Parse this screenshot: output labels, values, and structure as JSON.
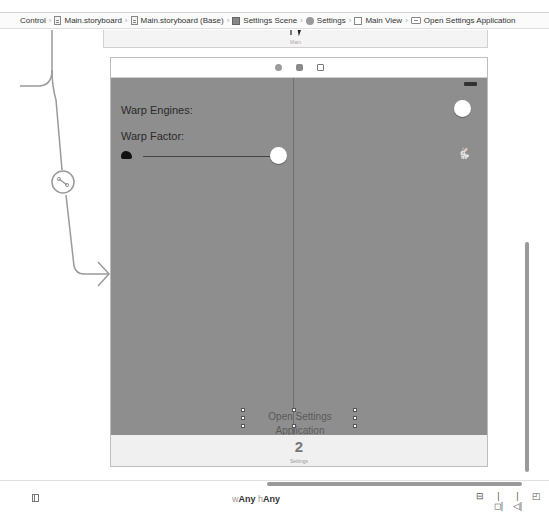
{
  "breadcrumb": {
    "items": [
      {
        "label": "Control",
        "icon": null
      },
      {
        "label": "Main.storyboard",
        "icon": "storyboard-icon"
      },
      {
        "label": "Main.storyboard (Base)",
        "icon": "storyboard-icon"
      },
      {
        "label": "Settings Scene",
        "icon": "scene-icon"
      },
      {
        "label": "Settings",
        "icon": "view-controller-icon"
      },
      {
        "label": "Main View",
        "icon": "view-icon"
      },
      {
        "label": "Open Settings Application",
        "icon": "button-icon"
      }
    ]
  },
  "canvas": {
    "top_scene_label": "Main",
    "scene": {
      "dock_icons": [
        "view-controller-icon",
        "first-responder-icon",
        "exit-icon"
      ],
      "labels": {
        "warp_engines": "Warp Engines:",
        "warp_factor": "Warp Factor:"
      },
      "slider": {
        "min_icon": "tortoise-icon",
        "max_icon": "hare-icon",
        "max_glyph": "🐇"
      },
      "open_settings_button": "Open Settings Application",
      "tab_bar": {
        "badge": "2",
        "label": "Settings"
      }
    }
  },
  "bottombar": {
    "size_class": {
      "w_prefix": "w",
      "w_value": "Any",
      "h_prefix": "h",
      "h_value": "Any"
    },
    "tools": [
      {
        "name": "align-tool",
        "glyph": "⊟"
      },
      {
        "name": "pin-tool",
        "glyph": "|◻|"
      },
      {
        "name": "resolve-issues-tool",
        "glyph": "|◁|"
      },
      {
        "name": "resizing-tool",
        "glyph": "◰"
      }
    ]
  },
  "colors": {
    "view_background": "#8e8e8e",
    "segue_line": "#9a9a9a"
  }
}
